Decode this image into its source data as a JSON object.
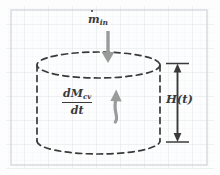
{
  "figure": {
    "kind": "hand-drawn-engineering-diagram",
    "width": 220,
    "height": 175,
    "background_color": "#fdfdfd",
    "grid_color": "#e9ecef",
    "frame_color": "#d5d8dc",
    "ink_color": "#3a3a3a",
    "accent_color": "#9a9a9a"
  },
  "labels": {
    "inlet_flow": {
      "symbol": "m",
      "accent": "dot",
      "subscript": "in",
      "full_text": "ṁ_in",
      "meaning": "inlet-mass-flow-rate"
    },
    "accumulation": {
      "numerator_main": "dM",
      "numerator_subscript": "cv",
      "denominator": "dt",
      "full_text": "dM_cv/dt",
      "meaning": "rate-of-change-of-control-volume-mass"
    },
    "height": {
      "text": "H(t)",
      "meaning": "liquid-height-as-function-of-time"
    }
  },
  "shapes": {
    "control_volume": {
      "name": "dashed-cylinder",
      "left_x": 37,
      "right_x": 160,
      "top_y": 65,
      "bottom_y": 141,
      "ellipse_ry": 13,
      "line_style": "dashed"
    },
    "inlet_arrow": {
      "name": "inlet-flow-arrow",
      "direction": "down",
      "x": 108,
      "from_y": 31,
      "to_y": 62,
      "color": "#9a9a9a"
    },
    "accumulation_arrow": {
      "name": "accumulation-arrow",
      "direction": "up",
      "x": 116,
      "from_y": 122,
      "to_y": 90,
      "color": "#9a9a9a"
    },
    "height_dimension": {
      "name": "height-dimension-arrow",
      "x": 177,
      "top_y": 63,
      "bottom_y": 142,
      "style": "double-headed-with-end-caps",
      "color": "#3a3a3a"
    }
  }
}
